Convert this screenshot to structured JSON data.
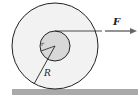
{
  "diagram": {
    "labels": {
      "force": "F",
      "outer_radius": "R",
      "inner_radius": "r"
    },
    "colors": {
      "outer_fill": "#f2f2f2",
      "inner_fill": "#d8d8d8",
      "stroke": "#222222",
      "ground": "#a9a9a9",
      "arrow": "#666666"
    }
  }
}
